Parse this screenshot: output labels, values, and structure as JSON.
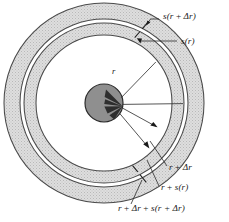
{
  "figure": {
    "geometry": {
      "center_x": 104,
      "center_y": 103,
      "outer_band_outer_radius": 100,
      "outer_band_inner_radius": 84,
      "gap_outer_radius": 84,
      "gap_inner_radius": 80,
      "inner_band_outer_radius": 80,
      "inner_band_inner_radius": 68,
      "hub_radius": 19
    },
    "colors": {
      "band_fill": "#d8d8d8",
      "band_outline": "#4a4a4a",
      "hub_fill": "#8f8f8f",
      "hub_outline": "#2b2b2b",
      "wedge_fill": "#2e2e2e",
      "leader_line": "#2a2a2a",
      "text": "#1a1a1a",
      "background": "#ffffff"
    },
    "labels": {
      "s_r_delta_r": {
        "text": "s(r + Δr)",
        "parts": {
          "lead": "s(r",
          "op": " + ",
          "tail": "Δr)"
        },
        "x": 163,
        "y": 19
      },
      "s_r": {
        "text": "s(r)",
        "x": 181,
        "y": 42
      },
      "r": {
        "text": "r",
        "x": 112,
        "y": 74
      },
      "r_plus_delta_r": {
        "text": "r + Δr",
        "parts": {
          "lead": "r",
          "op": " + ",
          "tail": "Δr"
        },
        "x": 169,
        "y": 170
      },
      "r_plus_s_r": {
        "text": "r + s(r)",
        "parts": {
          "lead": "r",
          "op": " + ",
          "tail": "s(r)"
        },
        "x": 161,
        "y": 190
      },
      "r_delta_r_s_r_delta_r": {
        "text": "r + Δr + s(r + Δr)",
        "parts": {
          "lead": "r",
          "op1": " + ",
          "mid": "Δr",
          "op2": " + ",
          "tail": "s(r + Δr)"
        },
        "x": 118,
        "y": 211
      }
    }
  }
}
